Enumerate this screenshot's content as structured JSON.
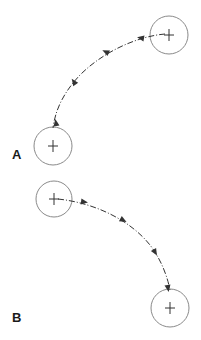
{
  "diagram": {
    "panels": [
      {
        "label": "A",
        "label_pos": [
          12,
          148
        ],
        "start_circle": {
          "cx": 169,
          "cy": 35,
          "r": 19
        },
        "end_circle": {
          "cx": 53,
          "cy": 146,
          "r": 19
        },
        "path": "M165,34 C140,36 105,50 80,75 C62,94 55,112 53,128",
        "arrows": [
          {
            "x": 141,
            "y": 38,
            "angle": 190
          },
          {
            "x": 106,
            "y": 52,
            "angle": 205
          },
          {
            "x": 74,
            "y": 82,
            "angle": 235
          },
          {
            "x": 56,
            "y": 123,
            "angle": 260
          }
        ],
        "direction": "counterclockwise"
      },
      {
        "label": "B",
        "label_pos": [
          12,
          311
        ],
        "start_circle": {
          "cx": 54,
          "cy": 199,
          "r": 18
        },
        "end_circle": {
          "cx": 170,
          "cy": 308,
          "r": 19
        },
        "path": "M58,199 C95,203 130,220 150,245 C163,262 168,280 170,290",
        "arrows": [
          {
            "x": 84,
            "y": 202,
            "angle": 8
          },
          {
            "x": 123,
            "y": 220,
            "angle": 28
          },
          {
            "x": 155,
            "y": 252,
            "angle": 60
          },
          {
            "x": 168,
            "y": 288,
            "angle": 80
          }
        ],
        "direction": "clockwise"
      }
    ],
    "colors": {
      "circle_stroke": "#8a8a8a",
      "path_stroke": "#333333",
      "cross_stroke": "#333333",
      "label": "#1a1a1a"
    }
  }
}
